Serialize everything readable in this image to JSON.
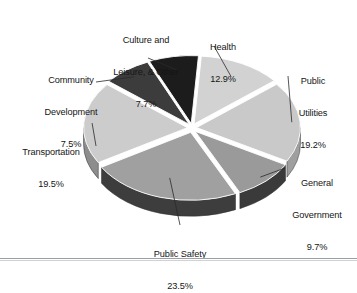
{
  "chart_data": {
    "type": "pie",
    "title": "",
    "subtitle": "",
    "xlabel": "",
    "ylabel": "",
    "legend_position": "none",
    "grid": false,
    "three_d": true,
    "exploded": true,
    "units": "percent",
    "categories": [
      "Health",
      "Public Utilities",
      "General Government",
      "Public Safety",
      "Transportation",
      "Community Development",
      "Culture and Leisure, & Other"
    ],
    "values": [
      12.9,
      19.2,
      9.7,
      23.5,
      19.5,
      7.5,
      7.7
    ],
    "value_labels": [
      "12.9%",
      "19.2%",
      "9.7%",
      "23.5%",
      "19.5%",
      "7.5%",
      "7.7%"
    ],
    "colors": [
      "#d2d2d2",
      "#c9c9c9",
      "#9a9a9a",
      "#a0a0a0",
      "#cccccc",
      "#3c3c3c",
      "#1c1c1c"
    ],
    "slices": [
      {
        "name": "Health",
        "label_line1": "Health",
        "label_line2": "",
        "percent_label": "12.9%",
        "value": 12.9,
        "color": "#d2d2d2",
        "side_color": "#a8a8a8"
      },
      {
        "name": "Public Utilities",
        "label_line1": "Public",
        "label_line2": "Utilities",
        "percent_label": "19.2%",
        "value": 19.2,
        "color": "#c9c9c9",
        "side_color": "#9f9f9f"
      },
      {
        "name": "General Government",
        "label_line1": "General",
        "label_line2": "Government",
        "percent_label": "9.7%",
        "value": 9.7,
        "color": "#9a9a9a",
        "side_color": "#3a3a3a"
      },
      {
        "name": "Public Safety",
        "label_line1": "Public Safety",
        "label_line2": "",
        "percent_label": "23.5%",
        "value": 23.5,
        "color": "#a0a0a0",
        "side_color": "#3d3d3d"
      },
      {
        "name": "Transportation",
        "label_line1": "Transportation",
        "label_line2": "",
        "percent_label": "19.5%",
        "value": 19.5,
        "color": "#cccccc",
        "side_color": "#8d8d8d"
      },
      {
        "name": "Community Development",
        "label_line1": "Community",
        "label_line2": "Development",
        "percent_label": "7.5%",
        "value": 7.5,
        "color": "#3c3c3c",
        "side_color": "#1e1e1e"
      },
      {
        "name": "Culture and Leisure, & Other",
        "label_line1": "Culture and",
        "label_line2": "Leisure, & Other",
        "percent_label": "7.7%",
        "value": 7.7,
        "color": "#1c1c1c",
        "side_color": "#101010"
      }
    ]
  },
  "geometry": {
    "cx": 192,
    "cy": 128,
    "rx": 104,
    "ry": 68,
    "depth": 16,
    "explode": 5,
    "start_angle_deg": -86
  },
  "style": {
    "background": "#ffffff",
    "text_color": "#151515",
    "leader_color": "#2a2a2a",
    "rule_color": "#9aa0a6"
  }
}
